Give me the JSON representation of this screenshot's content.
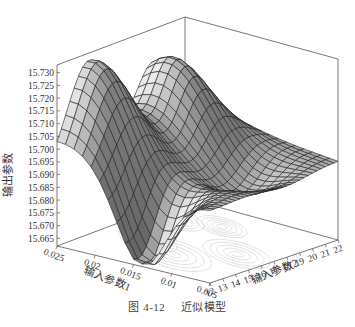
{
  "chart_data": {
    "type": "surface3d",
    "title": "",
    "caption": {
      "number": "图 4-12",
      "text": "近似模型"
    },
    "zlabel": "输出参数",
    "xlabel": "输入参数1",
    "ylabel": "输入参数2",
    "zticks": [
      "15.665",
      "15.670",
      "15.675",
      "15.680",
      "15.685",
      "15.690",
      "15.695",
      "15.700",
      "15.705",
      "15.710",
      "15.715",
      "15.720",
      "15.725",
      "15.730"
    ],
    "zlim": [
      15.662,
      15.733
    ],
    "xticks": [
      "0.025",
      "0.02",
      "0.015",
      "0.01",
      "0.005"
    ],
    "xlim": [
      0.025,
      0.005
    ],
    "yticks": [
      "12",
      "13",
      "14",
      "15",
      "16",
      "17",
      "18",
      "19",
      "20",
      "21",
      "22"
    ],
    "ylim": [
      12,
      22
    ],
    "surface_description": "Wavy surface: high ridge (~15.731) near param1=0.025 side at param2≈14-16, deep minimum (~15.663) near param1≈0.015, param2≈12; secondary peak (~15.725) near param2≈19; floor contour projection shown.",
    "grid": false,
    "contour_projection": true
  },
  "figure": {
    "caption_number": "图 4-12",
    "caption_text": "近似模型"
  }
}
